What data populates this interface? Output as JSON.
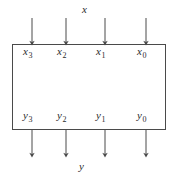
{
  "diagram": {
    "block": {
      "name": "processing-block",
      "fill": "#ffffff",
      "stroke": "#4a4a4a",
      "x": 12,
      "y": 44,
      "width": 154,
      "height": 86
    },
    "stroke_color": "#4a4a4a",
    "text_color": "#2b2b2b",
    "input_bus_label": "x",
    "output_bus_label": "y",
    "inputs": [
      {
        "base": "x",
        "index": "3",
        "arrow_x": 32
      },
      {
        "base": "x",
        "index": "2",
        "arrow_x": 66
      },
      {
        "base": "x",
        "index": "1",
        "arrow_x": 105
      },
      {
        "base": "x",
        "index": "0",
        "arrow_x": 146
      }
    ],
    "outputs": [
      {
        "base": "y",
        "index": "3",
        "arrow_x": 32
      },
      {
        "base": "y",
        "index": "2",
        "arrow_x": 66
      },
      {
        "base": "y",
        "index": "1",
        "arrow_x": 105
      },
      {
        "base": "y",
        "index": "0",
        "arrow_x": 146
      }
    ]
  }
}
